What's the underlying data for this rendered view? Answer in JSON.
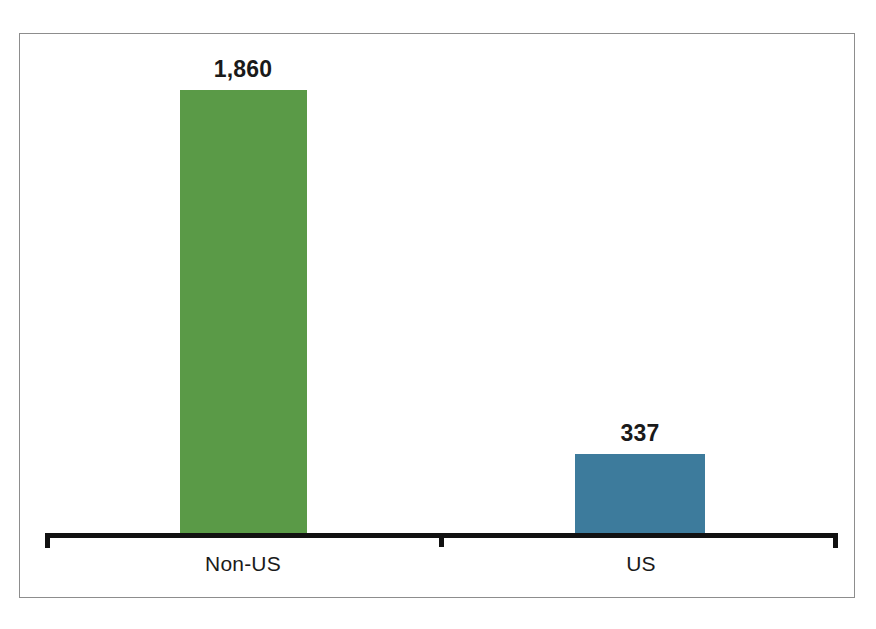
{
  "chart_data": {
    "type": "bar",
    "title": "",
    "subtitle": "",
    "xlabel": "",
    "ylabel": "",
    "categories": [
      "Non-US",
      "US"
    ],
    "values": [
      1860,
      337
    ],
    "value_labels": [
      "1,860",
      "337"
    ],
    "colors": [
      "#5a9a47",
      "#3d7b9c"
    ],
    "ylim": [
      0,
      1860
    ],
    "grid": false,
    "legend": null,
    "axis": {
      "baseline_color": "#111111",
      "has_end_ticks": true,
      "has_center_tick": true
    },
    "frame": {
      "border_color": "#8d8d8d",
      "background": "#ffffff"
    },
    "bars": [
      {
        "category": "Non-US",
        "value": 1860,
        "value_label": "1,860",
        "color": "#5a9a47"
      },
      {
        "category": "US",
        "value": 337,
        "value_label": "337",
        "color": "#3d7b9c"
      }
    ]
  }
}
